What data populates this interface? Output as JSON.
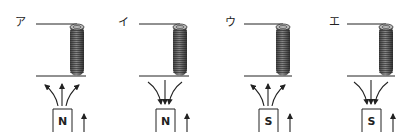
{
  "diagram": {
    "panels": [
      {
        "label": "ア",
        "pole": "N",
        "field_direction": "outward",
        "magnet_motion": "up"
      },
      {
        "label": "イ",
        "pole": "N",
        "field_direction": "inward",
        "magnet_motion": "up"
      },
      {
        "label": "ウ",
        "pole": "S",
        "field_direction": "outward",
        "magnet_motion": "up"
      },
      {
        "label": "エ",
        "pole": "S",
        "field_direction": "inward",
        "magnet_motion": "up"
      }
    ],
    "colors": {
      "line": "#222222",
      "coil": "#555555",
      "coil_dark": "#333333"
    }
  }
}
